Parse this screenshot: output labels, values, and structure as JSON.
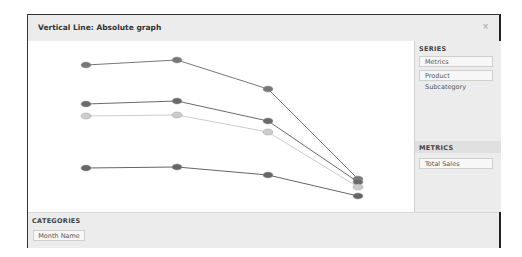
{
  "window": {
    "title": "Vertical Line: Absolute graph",
    "close_icon": "close-icon"
  },
  "side": {
    "series_header": "SERIES",
    "series_items": [
      "Metrics",
      "Product Subcategory"
    ],
    "metrics_header": "METRICS",
    "metrics_items": [
      "Total Sales"
    ]
  },
  "bottom": {
    "categories_header": "CATEGORIES",
    "categories_items": [
      "Month Name"
    ]
  },
  "chart_data": {
    "type": "line",
    "title": "Vertical Line: Absolute graph",
    "categories": [
      "1",
      "2",
      "3",
      "4"
    ],
    "xlabel": "Month Name",
    "ylabel": "Total Sales",
    "grid": false,
    "series": [
      {
        "name": "Series A",
        "color": "#777777",
        "px_y": [
          65,
          60,
          89,
          179
        ]
      },
      {
        "name": "Series B",
        "color": "#6a6a6a",
        "px_y": [
          104,
          101,
          121,
          182
        ]
      },
      {
        "name": "Series C",
        "color": "#cccccc",
        "px_y": [
          116,
          115,
          132,
          187
        ]
      },
      {
        "name": "Series D",
        "color": "#666666",
        "px_y": [
          168,
          167,
          175,
          196
        ]
      }
    ],
    "px_x": [
      86,
      177,
      268,
      358
    ]
  }
}
